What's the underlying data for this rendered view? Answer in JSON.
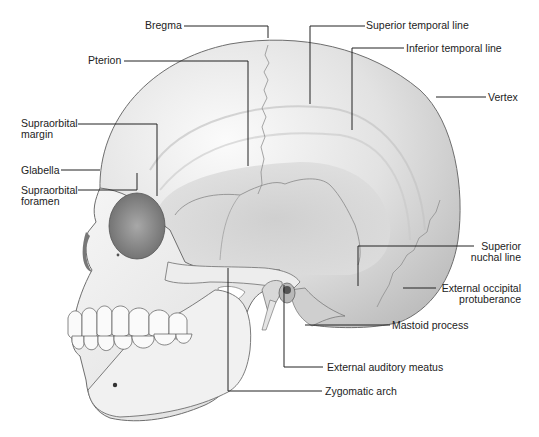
{
  "figure": {
    "colors": {
      "bone_light": "#f2f2f2",
      "bone_mid": "#d4d4d4",
      "bone_dark": "#9a9a9a",
      "outline": "#6e6e6e",
      "leader": "#222222",
      "background": "#ffffff"
    }
  },
  "labels": {
    "bregma": "Bregma",
    "pterion": "Pterion",
    "superior_temporal_line": "Superior temporal line",
    "inferior_temporal_line": "Inferior temporal line",
    "vertex": "Vertex",
    "supraorbital_margin_1": "Supraorbital",
    "supraorbital_margin_2": "margin",
    "glabella": "Glabella",
    "supraorbital_foramen_1": "Supraorbital",
    "supraorbital_foramen_2": "foramen",
    "superior_nuchal_line_1": "Superior",
    "superior_nuchal_line_2": "nuchal line",
    "external_occipital_protuberance_1": "External occipital",
    "external_occipital_protuberance_2": "protuberance",
    "mastoid_process": "Mastoid process",
    "external_auditory_meatus": "External auditory meatus",
    "zygomatic_arch": "Zygomatic arch"
  }
}
